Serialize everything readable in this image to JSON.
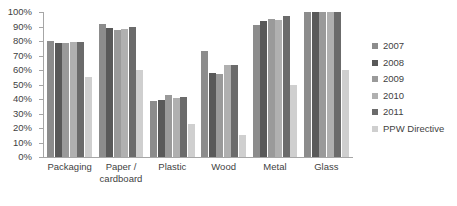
{
  "chart_data": {
    "type": "bar",
    "title": "",
    "subtitle": "",
    "xlabel": "",
    "ylabel": "",
    "ylim": [
      0,
      100
    ],
    "y_tick_labels": [
      "100%",
      "90%",
      "80%",
      "70%",
      "60%",
      "50%",
      "40%",
      "30%",
      "20%",
      "10%",
      "0%"
    ],
    "y_tick_values": [
      100,
      90,
      80,
      70,
      60,
      50,
      40,
      30,
      20,
      10,
      0
    ],
    "grid": false,
    "legend_position": "right",
    "units": "percent",
    "categories": [
      "Packaging",
      "Paper / cardboard",
      "Plastic",
      "Wood",
      "Metal",
      "Glass"
    ],
    "series": [
      {
        "name": "2007",
        "color": "#8c8c8c",
        "values": [
          80,
          91.5,
          38.5,
          73,
          91,
          100
        ]
      },
      {
        "name": "2008",
        "color": "#595959",
        "values": [
          78.5,
          89,
          39.5,
          58,
          94,
          100
        ]
      },
      {
        "name": "2009",
        "color": "#9a9a9a",
        "values": [
          78.5,
          87.5,
          42.5,
          57,
          95,
          100
        ]
      },
      {
        "name": "2010",
        "color": "#b0b0b0",
        "values": [
          79.5,
          88,
          41,
          63.5,
          94.5,
          100
        ]
      },
      {
        "name": "2011",
        "color": "#6b6b6b",
        "values": [
          79.5,
          90,
          41.5,
          63.5,
          97,
          100
        ]
      },
      {
        "name": "PPW Directive",
        "color": "#cfcfcf",
        "values": [
          55,
          60,
          22.5,
          15,
          49.5,
          60
        ]
      }
    ]
  },
  "axis": {
    "line_color": "#a6a6a6",
    "text_color": "#3f3f3f"
  }
}
